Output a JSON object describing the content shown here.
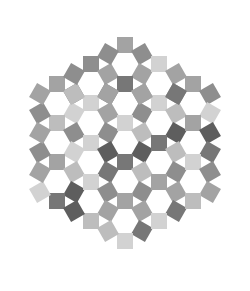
{
  "figure": {
    "width": 250,
    "height": 291,
    "background": "#ffffff"
  },
  "lattice": {
    "center_x": 125,
    "center_y": 142.5,
    "hex_spacing": 39.2,
    "square_size": 16,
    "ring_radius": 19.6,
    "hex_radius": 3
  },
  "palette": {
    "light": "#d2d2d2",
    "mid_light": "#bdbdbd",
    "mid": "#a3a3a3",
    "mid_dark": "#8e8e8e",
    "dark": "#777777",
    "darkest": "#5e5e5e"
  },
  "shade_sequence": [
    "mid",
    "light",
    "mid_dark",
    "mid_light",
    "dark",
    "mid",
    "light",
    "mid_dark",
    "dark",
    "mid_light",
    "mid",
    "darkest",
    "light",
    "mid_dark",
    "mid"
  ]
}
